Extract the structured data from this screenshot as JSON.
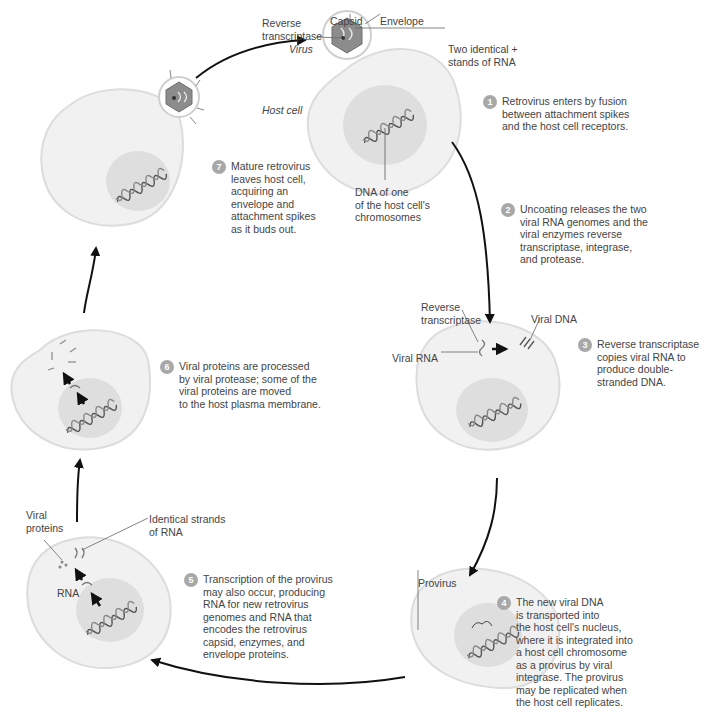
{
  "colors": {
    "cell_fill": "#f1f1f1",
    "cell_stroke": "#dcdcdc",
    "nucleus_fill": "#dedede",
    "capsid_fill": "#8c8c8c",
    "badge_fill": "#a8a8a8",
    "arrow": "#111111"
  },
  "labels": {
    "reverse_transcriptase_top": "Reverse\ntranscriptase",
    "capsid": "Capsid",
    "envelope": "Envelope",
    "virus": "Virus",
    "two_identical_rna": "Two identical +\nstands of RNA",
    "host_cell": "Host cell",
    "dna_of_host": "DNA of one\nof the host cell's\nchromosomes",
    "reverse_transcriptase_step3": "Reverse\ntranscriptase",
    "viral_dna": "Viral DNA",
    "viral_rna": "Viral RNA",
    "provirus": "Provirus",
    "viral_proteins": "Viral\nproteins",
    "identical_strands_rna": "Identical strands\nof RNA",
    "rna": "RNA"
  },
  "steps": [
    {
      "number": "1",
      "text": "Retrovirus enters by fusion\nbetween attachment spikes\nand the host cell receptors."
    },
    {
      "number": "2",
      "text": "Uncoating releases the two\nviral RNA genomes and the\nviral enzymes reverse\ntranscriptase, integrase,\nand protease."
    },
    {
      "number": "3",
      "text": "Reverse transcriptase\ncopies viral RNA to\nproduce double-\nstranded DNA."
    },
    {
      "number": "4",
      "text": "The new viral DNA\nis transported into\nthe host cell's nucleus,\nwhere it is integrated into\na host cell chromosome\nas a provirus by viral\nintegrase. The provirus\nmay be replicated when\nthe host cell replicates."
    },
    {
      "number": "5",
      "text": "Transcription of the provirus\nmay also occur, producing\nRNA for new retrovirus\ngenomes and RNA that\nencodes the retrovirus\ncapsid, enzymes, and\nenvelope proteins."
    },
    {
      "number": "6",
      "text": "Viral proteins are processed\nby viral protease; some of the\nviral proteins are moved\nto the host plasma membrane."
    },
    {
      "number": "7",
      "text": "Mature retrovirus\nleaves host cell,\nacquiring an\nenvelope and\nattachment spikes\nas it buds out."
    }
  ]
}
